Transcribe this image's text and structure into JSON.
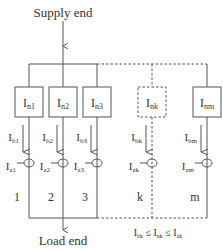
{
  "labels": {
    "supply": "Supply end",
    "load": "Load end",
    "inequality": {
      "a": "I",
      "a_sub": "bk",
      "le1": " ≤ ",
      "b": "I",
      "b_sub": "nk",
      "le2": " ≤ ",
      "c": "I",
      "c_sub": "zk"
    }
  },
  "branches": [
    {
      "id": "1",
      "x": 29,
      "dashed": false,
      "box": {
        "main": "I",
        "sub": "n1"
      },
      "flow": {
        "main": "I",
        "sub": "b1"
      },
      "limit": {
        "main": "I",
        "sub": "z1"
      },
      "number": "1"
    },
    {
      "id": "2",
      "x": 63,
      "dashed": false,
      "box": {
        "main": "I",
        "sub": "n2"
      },
      "flow": {
        "main": "I",
        "sub": "b2"
      },
      "limit": {
        "main": "I",
        "sub": "z2"
      },
      "number": "2"
    },
    {
      "id": "3",
      "x": 97,
      "dashed": false,
      "box": {
        "main": "I",
        "sub": "n3"
      },
      "flow": {
        "main": "I",
        "sub": "b3"
      },
      "limit": {
        "main": "I",
        "sub": "z3"
      },
      "number": "3"
    },
    {
      "id": "k",
      "x": 152,
      "dashed": true,
      "box": {
        "main": "I",
        "sub": "nk"
      },
      "flow": {
        "main": "I",
        "sub": "bk"
      },
      "limit": {
        "main": "I",
        "sub": "zk"
      },
      "number": "k"
    },
    {
      "id": "m",
      "x": 207,
      "dashed": false,
      "box": {
        "main": "I",
        "sub": "nm"
      },
      "flow": {
        "main": "I",
        "sub": "bm"
      },
      "limit": {
        "main": "I",
        "sub": "zm"
      },
      "number": "m"
    }
  ],
  "colors": {
    "line": "#555555",
    "text": "#333333",
    "background": "#ffffff"
  }
}
